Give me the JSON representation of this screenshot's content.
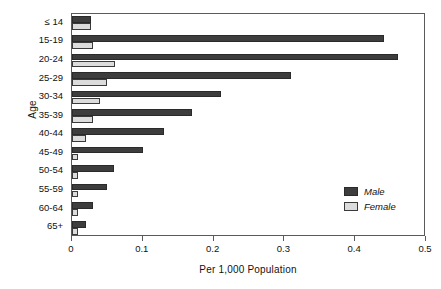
{
  "chart_data": {
    "type": "bar",
    "orientation": "horizontal",
    "title": "",
    "xlabel": "Per 1,000 Population",
    "ylabel": "Age",
    "xlim": [
      0,
      0.5
    ],
    "xticks": [
      "0",
      "0.1",
      "0.2",
      "0.3",
      "0.4",
      "0.5"
    ],
    "xtick_values": [
      0,
      0.1,
      0.2,
      0.3,
      0.4,
      0.5
    ],
    "grid": false,
    "legend_position": "inside-lower-right",
    "categories": [
      "≤ 14",
      "15-19",
      "20-24",
      "25-29",
      "30-34",
      "35-39",
      "40-44",
      "45-49",
      "50-54",
      "55-59",
      "60-64",
      "65+"
    ],
    "series": [
      {
        "name": "Male",
        "color": "#3d3d3d",
        "values": [
          0.027,
          0.44,
          0.46,
          0.31,
          0.21,
          0.17,
          0.13,
          0.1,
          0.06,
          0.05,
          0.03,
          0.02
        ]
      },
      {
        "name": "Female",
        "color": "#dcdcdc",
        "values": [
          0.027,
          0.029,
          0.061,
          0.05,
          0.04,
          0.03,
          0.02,
          0.008,
          0.008,
          0.008,
          0.008,
          0.008
        ]
      }
    ]
  },
  "legend": {
    "entries": [
      {
        "label": "Male",
        "swatch": "male"
      },
      {
        "label": "Female",
        "swatch": "female"
      }
    ]
  }
}
